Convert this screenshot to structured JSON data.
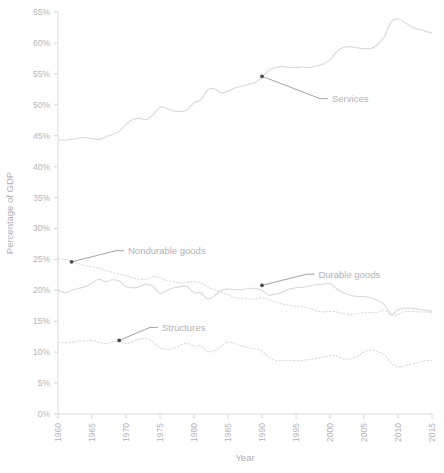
{
  "chart_data": {
    "type": "line",
    "title": "",
    "subtitle": "",
    "xlabel": "Year",
    "ylabel": "Percentage of GDP",
    "xlim": [
      1960,
      2015
    ],
    "ylim": [
      0,
      65
    ],
    "grid": false,
    "legend_position": "inline-annotations",
    "x_tick_labels": [
      "1960",
      "1965",
      "1970",
      "1975",
      "1980",
      "1985",
      "1990",
      "1995",
      "2000",
      "2005",
      "2010",
      "2015"
    ],
    "x_ticks": [
      1960,
      1965,
      1970,
      1975,
      1980,
      1985,
      1990,
      1995,
      2000,
      2005,
      2010,
      2015
    ],
    "y_tick_labels": [
      "0%",
      "5%",
      "10%",
      "15%",
      "20%",
      "25%",
      "30%",
      "35%",
      "40%",
      "45%",
      "50%",
      "55%",
      "60%",
      "65%"
    ],
    "y_ticks": [
      0,
      5,
      10,
      15,
      20,
      25,
      30,
      35,
      40,
      45,
      50,
      55,
      60,
      65
    ],
    "x": [
      1960,
      1961,
      1962,
      1963,
      1964,
      1965,
      1966,
      1967,
      1968,
      1969,
      1970,
      1971,
      1972,
      1973,
      1974,
      1975,
      1976,
      1977,
      1978,
      1979,
      1980,
      1981,
      1982,
      1983,
      1984,
      1985,
      1986,
      1987,
      1988,
      1989,
      1990,
      1991,
      1992,
      1993,
      1994,
      1995,
      1996,
      1997,
      1998,
      1999,
      2000,
      2001,
      2002,
      2003,
      2004,
      2005,
      2006,
      2007,
      2008,
      2009,
      2010,
      2011,
      2012,
      2013,
      2014,
      2015
    ],
    "series": [
      {
        "name": "Services",
        "style": "solid",
        "color": "#d9d9dd",
        "annotation": {
          "label": "Services",
          "point_x": 1990,
          "point_y": 54.6,
          "label_x": 2000,
          "label_y": 51.0
        },
        "values": [
          44.3,
          44.3,
          44.4,
          44.6,
          44.7,
          44.5,
          44.4,
          44.8,
          45.2,
          45.7,
          46.8,
          47.6,
          47.8,
          47.6,
          48.4,
          49.6,
          49.4,
          49.0,
          48.9,
          49.2,
          50.3,
          50.8,
          52.4,
          52.6,
          51.9,
          52.2,
          52.7,
          53.0,
          53.3,
          53.6,
          54.4,
          55.6,
          56.0,
          56.2,
          56.0,
          56.0,
          56.1,
          56.0,
          56.3,
          56.6,
          57.3,
          58.6,
          59.3,
          59.4,
          59.2,
          59.1,
          59.1,
          59.7,
          61.0,
          63.4,
          63.9,
          63.3,
          62.6,
          62.2,
          61.9,
          61.6
        ]
      },
      {
        "name": "Durable goods",
        "style": "solid",
        "color": "#d9d9dd",
        "annotation": {
          "label": "Durable goods",
          "point_x": 1990,
          "point_y": 20.8,
          "label_x": 1998,
          "label_y": 22.6
        },
        "values": [
          20.1,
          19.6,
          20.0,
          20.3,
          20.6,
          21.2,
          21.8,
          21.4,
          21.7,
          21.5,
          20.6,
          20.4,
          20.6,
          21.0,
          20.6,
          19.5,
          20.0,
          20.4,
          20.6,
          20.6,
          19.6,
          19.6,
          18.6,
          19.1,
          20.0,
          20.2,
          20.1,
          20.1,
          20.3,
          20.3,
          20.0,
          19.2,
          19.4,
          19.7,
          20.2,
          20.4,
          20.5,
          20.7,
          20.9,
          21.0,
          21.1,
          20.2,
          19.6,
          19.2,
          19.0,
          19.0,
          18.8,
          18.4,
          17.7,
          16.1,
          16.9,
          17.1,
          17.1,
          16.9,
          16.8,
          16.6
        ]
      },
      {
        "name": "Nondurable goods",
        "style": "dotted",
        "color": "#d9d9dd",
        "annotation": {
          "label": "Nondurable goods",
          "point_x": 1962,
          "point_y": 24.6,
          "label_x": 1970,
          "label_y": 26.4
        },
        "values": [
          25.2,
          25.0,
          24.7,
          24.3,
          24.0,
          23.8,
          23.6,
          23.2,
          22.9,
          22.6,
          22.4,
          22.0,
          21.8,
          21.8,
          22.2,
          22.0,
          21.6,
          21.4,
          21.2,
          21.3,
          21.4,
          21.2,
          20.6,
          20.1,
          19.7,
          19.3,
          18.8,
          18.7,
          18.6,
          18.6,
          18.8,
          18.5,
          18.1,
          17.8,
          17.6,
          17.4,
          17.3,
          17.1,
          16.7,
          16.5,
          16.6,
          16.5,
          16.2,
          16.1,
          16.2,
          16.4,
          16.4,
          16.4,
          16.8,
          16.0,
          16.1,
          16.6,
          16.6,
          16.5,
          16.5,
          16.4
        ]
      },
      {
        "name": "Structures",
        "style": "dotted",
        "color": "#d9d9dd",
        "annotation": {
          "label": "Structures",
          "point_x": 1969,
          "point_y": 11.9,
          "label_x": 1975,
          "label_y": 14.0
        },
        "values": [
          11.6,
          11.5,
          11.6,
          11.8,
          11.8,
          11.9,
          11.6,
          11.4,
          11.6,
          11.9,
          11.4,
          11.7,
          12.1,
          12.2,
          11.6,
          10.7,
          10.4,
          10.6,
          11.1,
          11.4,
          11.0,
          11.0,
          10.1,
          10.2,
          11.0,
          11.6,
          11.4,
          11.0,
          10.7,
          10.6,
          10.2,
          9.2,
          8.7,
          8.6,
          8.7,
          8.6,
          8.7,
          8.8,
          9.0,
          9.2,
          9.4,
          9.4,
          8.9,
          8.9,
          9.3,
          10.0,
          10.4,
          10.1,
          9.6,
          8.2,
          7.6,
          7.8,
          8.1,
          8.3,
          8.6,
          8.7
        ]
      }
    ]
  },
  "axes": {
    "y_axis_title": "Percentage of GDP",
    "x_axis_title": "Year"
  }
}
